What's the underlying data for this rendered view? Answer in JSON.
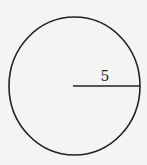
{
  "diagram": {
    "type": "circle",
    "shape": "circle",
    "radius_label": "5",
    "colors": {
      "background": "#f4f4f2",
      "stroke": "#222222"
    }
  }
}
